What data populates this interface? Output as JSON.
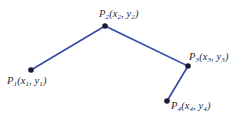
{
  "figure": {
    "type": "polyline-diagram",
    "background_color": "#ffffff",
    "line_color": "#3b4da8",
    "vertex_color": "#1b1b38",
    "label_color": "#2b2b33",
    "width": 249,
    "height": 121
  },
  "chart_data": {
    "type": "line",
    "title": "",
    "xlabel": "",
    "ylabel": "",
    "grid": false,
    "legend": "none",
    "series": [
      {
        "name": "polyline",
        "points": [
          {
            "id": "P1",
            "x": 31,
            "y": 70
          },
          {
            "id": "P2",
            "x": 105,
            "y": 26
          },
          {
            "id": "P3",
            "x": 188,
            "y": 66
          },
          {
            "id": "P4",
            "x": 167,
            "y": 101
          }
        ]
      }
    ]
  },
  "points": [
    {
      "name": "P1",
      "label_base": "P",
      "label_sub": "1",
      "coords_open": "(x",
      "coords_sub1": "1",
      "coords_mid": ", y",
      "coords_sub2": "1",
      "coords_close": ")",
      "full_label": "P1(x1, y1)"
    },
    {
      "name": "P2",
      "label_base": "P",
      "label_sub": "2",
      "coords_open": "(x",
      "coords_sub1": "2",
      "coords_mid": ", y",
      "coords_sub2": "2",
      "coords_close": ")",
      "full_label": "P2(x2, y2)"
    },
    {
      "name": "P3",
      "label_base": "P",
      "label_sub": "3",
      "coords_open": "(x",
      "coords_sub1": "3",
      "coords_mid": ", y",
      "coords_sub2": "3",
      "coords_close": ")",
      "full_label": "P3(x3, y3)"
    },
    {
      "name": "P4",
      "label_base": "P",
      "label_sub": "4",
      "coords_open": "(x",
      "coords_sub1": "4",
      "coords_mid": ", y",
      "coords_sub2": "4",
      "coords_close": ")",
      "full_label": "P4(x4, y4)"
    }
  ]
}
